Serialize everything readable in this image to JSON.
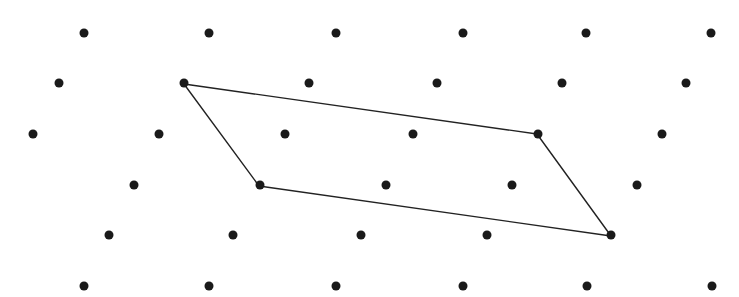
{
  "diagram": {
    "type": "lattice-with-fundamental-parallelogram",
    "background": "#ffffff",
    "dot_color": "#1a1a1a",
    "line_color": "#222222",
    "dot_radius": 4.5,
    "line_width": 1.4,
    "rows": [
      {
        "y": 33,
        "xs": [
          84,
          209,
          336,
          463,
          586,
          711
        ]
      },
      {
        "y": 83,
        "xs": [
          59,
          184,
          309,
          437,
          562,
          686
        ]
      },
      {
        "y": 134,
        "xs": [
          33,
          159,
          285,
          413,
          538,
          662
        ]
      },
      {
        "y": 185,
        "xs": [
          134,
          260,
          386,
          512,
          637
        ]
      },
      {
        "y": 235,
        "xs": [
          109,
          233,
          361,
          487,
          611
        ]
      },
      {
        "y": 286,
        "xs": [
          84,
          209,
          336,
          463,
          587,
          712
        ]
      }
    ],
    "parallelogram": {
      "vertices": [
        [
          184,
          84
        ],
        [
          537,
          134
        ],
        [
          611,
          236
        ],
        [
          259,
          186
        ]
      ]
    }
  }
}
